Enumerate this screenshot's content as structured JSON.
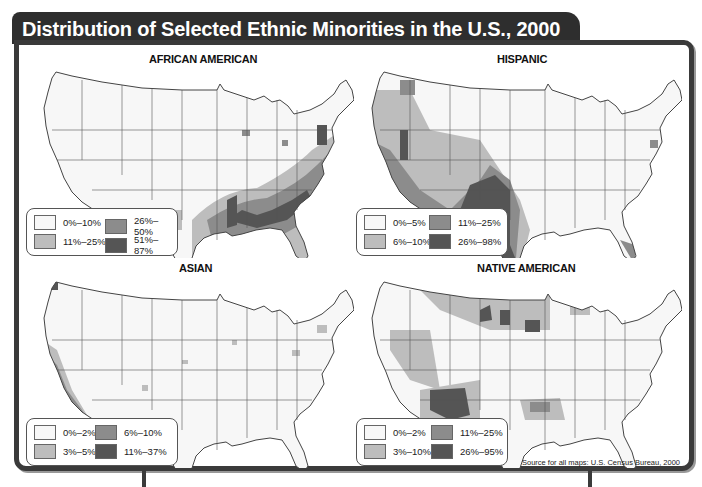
{
  "title": "Distribution of Selected Ethnic Minorities in the U.S., 2000",
  "source": "Source for all maps: U.S. Census Bureau, 2000",
  "colors": {
    "frame": "#3a3a3a",
    "title_bg": "#2e2e2e",
    "level1": "#f7f7f7",
    "level2": "#bdbdbd",
    "level3": "#8c8c8c",
    "level4": "#555555",
    "state_line": "#444444"
  },
  "maps": [
    {
      "title": "AFRICAN AMERICAN",
      "legend": [
        "0%–10%",
        "11%–25%",
        "26%–50%",
        "51%–87%"
      ],
      "concentration": "Southeast, Mississippi Delta, Atlantic coastal plain, large eastern cities"
    },
    {
      "title": "HISPANIC",
      "legend": [
        "0%–5%",
        "6%–10%",
        "11%–25%",
        "26%–98%"
      ],
      "concentration": "Southwest border states, California, Texas, New Mexico, Arizona, Colorado, Florida"
    },
    {
      "title": "ASIAN",
      "legend": [
        "0%–2%",
        "3%–5%",
        "6%–10%",
        "11%–37%"
      ],
      "concentration": "California coast, Washington, scattered metro counties, Northeast corridor"
    },
    {
      "title": "NATIVE AMERICAN",
      "legend": [
        "0%–2%",
        "3%–10%",
        "11%–25%",
        "26%–95%"
      ],
      "concentration": "Four Corners (Arizona/New Mexico), Dakotas, Montana, Oklahoma, Nevada"
    }
  ]
}
